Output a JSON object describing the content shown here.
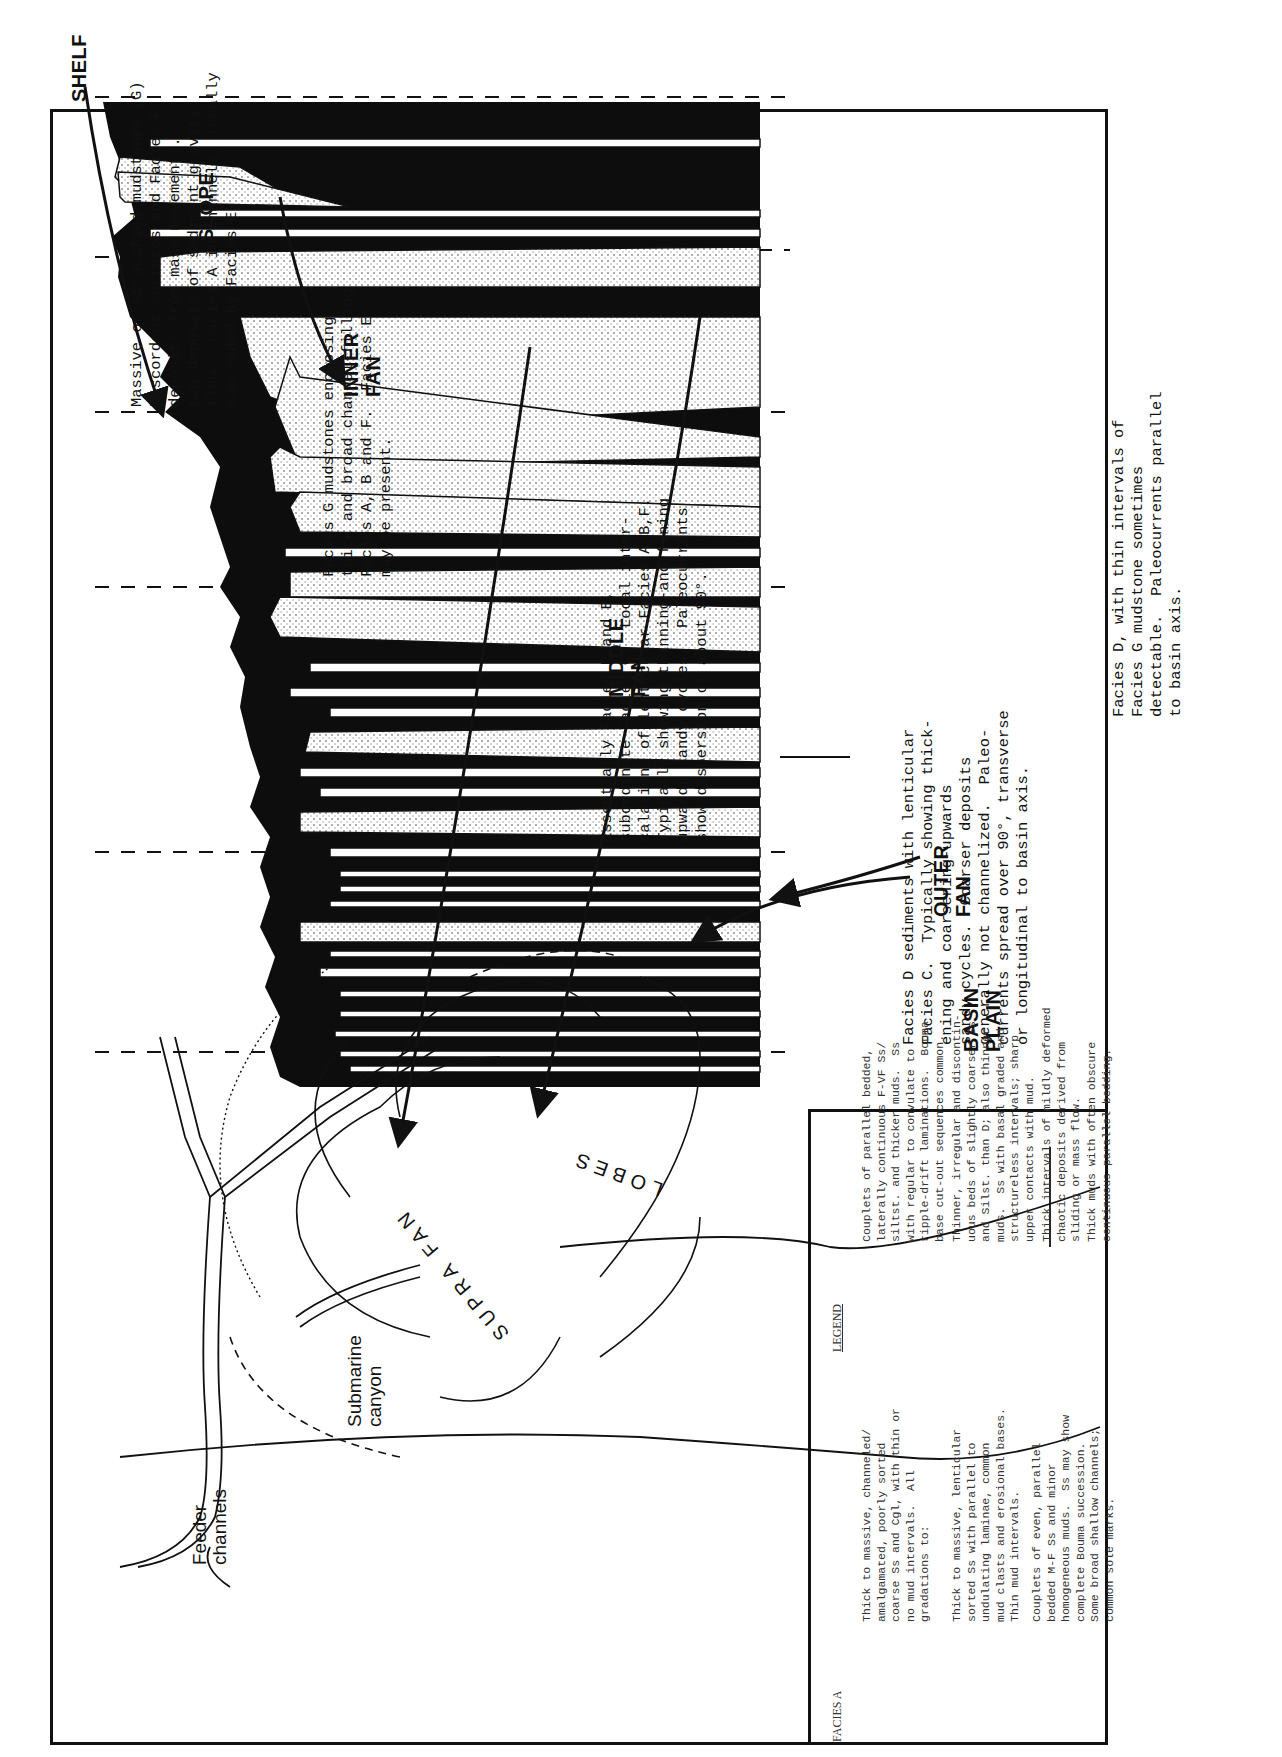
{
  "figure": {
    "orientation": "rotated-90-ccw",
    "zones": [
      {
        "id": "shelf",
        "label": "SHELF"
      },
      {
        "id": "slope",
        "label": "SLOPE"
      },
      {
        "id": "inner_fan",
        "label": "INNER\nFAN"
      },
      {
        "id": "middle_fan",
        "label": "MIDDLE\nFAN"
      },
      {
        "id": "outer_fan",
        "label": "OUTER\nFAN"
      },
      {
        "id": "basin_plain",
        "label": "BASIN\nPLAIN"
      }
    ],
    "zone_descriptions": [
      {
        "zone": "slope",
        "text": "Massive or stratified mudstones (G)\nDiscordant surfaces and Facies F\ndeposits from mass movements.\nLag deposits of sediment gravity\nflow.  Facies A in channels, locally\nsucceeded by Facies E."
      },
      {
        "zone": "inner_fan",
        "text": "Facies G mudstones enclosing\nthick and broad channel-filling\nFacies A, B and F.  Facies E\nmay be present."
      },
      {
        "zone": "middle_fan",
        "text": "Essentially Facies D and E,\nsubordinate Facies C.  Local inter-\ncalations of lenticular Facies A,B,F.\nTypically showing thinning-and-fining\nupwards sandy cycles.  Paleocurrents\nshow dispersion of about 90°."
      },
      {
        "zone": "outer_fan",
        "text": "Facies D sediments with lenticular\nFacies C.  Typically showing thick-\nening and coarsening-upwards\nsandy cycles.  Coarser deposits\ngenerally not channelized.  Paleo-\ncurrents spread over 90°, transverse\nor longitudinal to basin axis."
      },
      {
        "zone": "basin_plain",
        "text": "Facies D, with thin intervals of\nFacies G mudstone sometimes\ndetectable.  Paleocurrents parallel\nto basin axis."
      }
    ],
    "map_labels": {
      "feeder_channels": "Feeder\nchannels",
      "submarine_canyon": "Submarine\ncanyon",
      "supra_fan": "SUPRA FAN",
      "lobes": "LOBES"
    }
  },
  "legend": {
    "title": "LEGEND",
    "items": [
      {
        "label": "FACIES A",
        "text": "Thick to massive, channeled/\namalgamated, poorly sorted\ncoarse Ss and Cgl, with thin or\nno mud intervals.  All\ngradations to:"
      },
      {
        "label": "FACIES B",
        "text": "Thick to massive, lenticular\nsorted Ss with parallel to\nundulating laminae, common\nmud clasts and erosional bases.\nThin mud intervals."
      },
      {
        "label": "FACIES C",
        "text": "Couplets of even, parallel\nbedded M-F Ss and minor\nhomogeneous muds.  Ss may show\ncomplete Bouma succession.\nSome broad shallow channels;\ncommon sole marks."
      },
      {
        "label": "FACIES D",
        "text": "Couplets of parallel bedded,\nlaterally continuous F-VF Ss/\nsiltst. and thicker muds.  Ss\nwith regular to convulate to\nripple-drift laminations.  Bouma\nbase cut-out sequences common."
      },
      {
        "label": "FACIES E",
        "text": "Thinner, irregular and discontin-\nuous beds of slightly coarser Ss\nand Silst. than D; also thinner\nmuds.  Ss with basal graded and\nstructureless intervals; sharp\nupper contacts with mud."
      },
      {
        "label": "FACIES F",
        "text": "Thick intervals of mildly deformed\nchaotic deposits derived from\nsliding or mass flow."
      },
      {
        "label": "FACIES G",
        "text": "Thick muds with often obscure\ncontinuous parallel bedding."
      }
    ]
  },
  "colors": {
    "ink": "#111111",
    "paper": "#ffffff",
    "mud": "#0d0d0d",
    "sand_dot": "#444444"
  }
}
